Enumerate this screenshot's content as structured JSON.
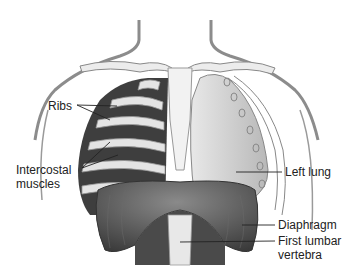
{
  "diagram": {
    "labels": {
      "ribs": "Ribs",
      "intercostal_line1": "Intercostal",
      "intercostal_line2": "muscles",
      "left_lung": "Left lung",
      "diaphragm": "Diaphragm",
      "lumbar_line1": "First lumbar",
      "lumbar_line2": "vertebra"
    },
    "colors": {
      "skin_outline": "#888888",
      "bone": "#e6e6e6",
      "lung": "#c8c8c8",
      "muscle": "#4a4a4a",
      "diaphragm": "#5a5a5a"
    }
  }
}
